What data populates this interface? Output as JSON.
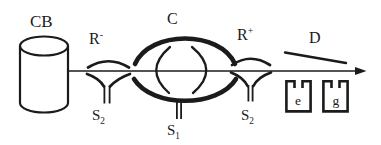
{
  "figure": {
    "colors": {
      "ink": "#1b1b1b",
      "background": "#ffffff"
    },
    "labels": {
      "cylinder": "CB",
      "left_electrode_base": "R",
      "left_electrode_sup": "-",
      "condenser": "C",
      "right_electrode_base": "R",
      "right_electrode_sup": "+",
      "deflector": "D",
      "slit_left_base": "S",
      "slit_left_sub": "2",
      "slit_center_base": "S",
      "slit_center_sub": "1",
      "slit_right_base": "S",
      "slit_right_sub": "2",
      "cup_e": "e",
      "cup_g": "g"
    }
  }
}
